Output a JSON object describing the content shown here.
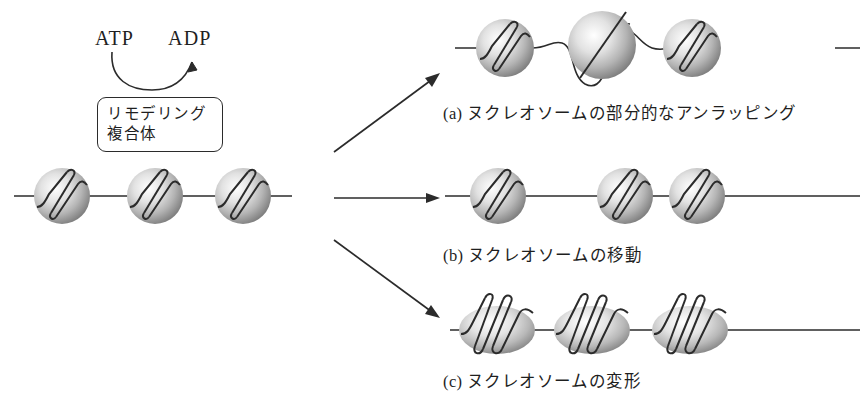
{
  "figure": {
    "domain_note": "chromatin remodeling diagram",
    "background_color": "#ffffff",
    "ink_color": "#1f1f1f"
  },
  "energy": {
    "substrate_label": "ATP",
    "product_label": "ADP",
    "arrow_name": "atp-to-adp-curved-arrow"
  },
  "complex": {
    "line1": "リモデリング",
    "line2": "複合体"
  },
  "input": {
    "caption": "",
    "nucleosome_count": 3,
    "nucleosomes": [
      {
        "cx": 62,
        "cy": 196,
        "r": 28
      },
      {
        "cx": 155,
        "cy": 196,
        "r": 28
      },
      {
        "cx": 243,
        "cy": 196,
        "r": 28
      }
    ],
    "dna_y": 196,
    "dna_x_start": 14,
    "dna_x_end": 292
  },
  "arrows": [
    {
      "name": "arrow-to-unwrapping",
      "label": "(a)"
    },
    {
      "name": "arrow-to-sliding",
      "label": "(b)"
    },
    {
      "name": "arrow-to-deformation",
      "label": "(c)"
    }
  ],
  "outcomes": [
    {
      "id": "a",
      "marker": "(a)",
      "caption": "ヌクレオソームの部分的なアンラッピング",
      "full_label": "(a) ヌクレオソームの部分的なアンラッピング",
      "nucleosome_count": 3,
      "nucleosomes": [
        {
          "cx": 505,
          "cy": 48,
          "rx": 29,
          "ry": 29,
          "wrapped": true
        },
        {
          "cx": 602,
          "cy": 45,
          "rx": 34,
          "ry": 34,
          "wrapped": false
        },
        {
          "cx": 692,
          "cy": 48,
          "rx": 29,
          "ry": 29,
          "wrapped": true
        }
      ],
      "dna_y": 48
    },
    {
      "id": "b",
      "marker": "(b)",
      "caption": "ヌクレオソームの移動",
      "full_label": "(b) ヌクレオソームの移動",
      "nucleosome_count": 3,
      "nucleosomes": [
        {
          "cx": 498,
          "cy": 196,
          "rx": 28,
          "ry": 28,
          "wrapped": true
        },
        {
          "cx": 625,
          "cy": 196,
          "rx": 28,
          "ry": 28,
          "wrapped": true
        },
        {
          "cx": 697,
          "cy": 196,
          "rx": 28,
          "ry": 28,
          "wrapped": true
        }
      ],
      "dna_y": 196
    },
    {
      "id": "c",
      "marker": "(c)",
      "caption": "ヌクレオソームの変形",
      "full_label": "(c) ヌクレオソームの変形",
      "nucleosome_count": 3,
      "nucleosomes": [
        {
          "cx": 497,
          "cy": 330,
          "rx": 38,
          "ry": 24,
          "wrapped": true
        },
        {
          "cx": 592,
          "cy": 330,
          "rx": 38,
          "ry": 24,
          "wrapped": true
        },
        {
          "cx": 690,
          "cy": 330,
          "rx": 38,
          "ry": 24,
          "wrapped": true
        }
      ],
      "dna_y": 330
    }
  ],
  "colors": {
    "sphere_highlight": "#ffffff",
    "sphere_mid": "#b4b4b4",
    "sphere_edge": "#7d7d7d",
    "dna_stroke": "#2b2b2b",
    "text": "#1f1f1f"
  }
}
